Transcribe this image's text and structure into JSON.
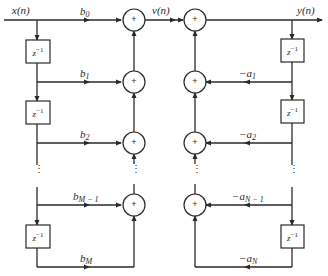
{
  "diagram": {
    "signals": {
      "input": "x(n)",
      "intermediate": "v(n)",
      "output": "y(n)"
    },
    "delay_label": "z",
    "delay_exp": "−1",
    "adder_symbol": "+",
    "feedforward": [
      {
        "base": "b",
        "sub": "0"
      },
      {
        "base": "b",
        "sub": "1"
      },
      {
        "base": "b",
        "sub": "2"
      },
      {
        "base": "b",
        "sub": "M − 1"
      },
      {
        "base": "b",
        "sub": "M"
      }
    ],
    "feedback": [
      {
        "base": "−a",
        "sub": "1"
      },
      {
        "base": "−a",
        "sub": "2"
      },
      {
        "base": "−a",
        "sub": "N − 1"
      },
      {
        "base": "−a",
        "sub": "N"
      }
    ],
    "ellipsis": "⋮"
  }
}
